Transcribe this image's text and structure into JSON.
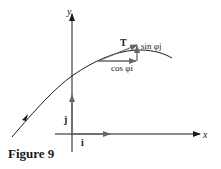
{
  "figure": {
    "caption": "Figure 9",
    "axes": {
      "x_label": "x",
      "y_label": "y"
    },
    "unit_vectors": {
      "i_label": "i",
      "j_label": "j"
    },
    "tangent": {
      "T_label": "T",
      "horizontal_component_label": "cos φi",
      "vertical_component_label": "sin φj"
    },
    "colors": {
      "ink": "#1a1a1a",
      "vector": "#555555"
    }
  }
}
